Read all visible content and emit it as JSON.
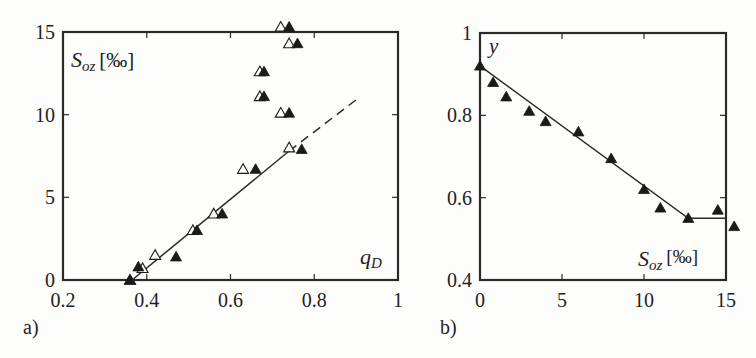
{
  "chart_data": [
    {
      "panel_label": "a)",
      "type": "scatter",
      "title": "",
      "xlabel": "q_D",
      "xlabel_main": "q",
      "xlabel_sub": "D",
      "ylabel": "S_oz [‰]",
      "ylabel_main": "S",
      "ylabel_sub": "oz",
      "ylabel_unit": "[‰]",
      "xlim": [
        0.2,
        1.0
      ],
      "ylim": [
        0,
        15
      ],
      "xticks": [
        "0.2",
        "0.4",
        "0.6",
        "0.8",
        "1"
      ],
      "yticks": [
        "0",
        "5",
        "10",
        "15"
      ],
      "grid": false,
      "legend": "none",
      "series": [
        {
          "name": "open triangles",
          "marker": "open-triangle",
          "x": [
            0.36,
            0.39,
            0.42,
            0.51,
            0.56,
            0.63,
            0.67,
            0.67,
            0.72,
            0.72,
            0.74,
            0.74
          ],
          "y": [
            0.0,
            0.7,
            1.5,
            3.0,
            4.0,
            6.7,
            11.1,
            12.6,
            10.1,
            15.3,
            8.0,
            14.3
          ]
        },
        {
          "name": "filled triangles",
          "marker": "filled-triangle",
          "x": [
            0.36,
            0.38,
            0.47,
            0.52,
            0.58,
            0.66,
            0.68,
            0.68,
            0.74,
            0.74,
            0.76,
            0.77
          ],
          "y": [
            0.0,
            0.8,
            1.4,
            3.0,
            4.0,
            6.7,
            11.1,
            12.6,
            10.1,
            15.3,
            14.3,
            7.9
          ]
        },
        {
          "name": "fit line (solid)",
          "type": "line",
          "style": "solid",
          "x": [
            0.365,
            0.74
          ],
          "y": [
            0.0,
            7.8
          ]
        },
        {
          "name": "fit line (extrapolated, dashed)",
          "type": "line",
          "style": "dashed",
          "x": [
            0.74,
            0.9
          ],
          "y": [
            7.8,
            10.9
          ]
        }
      ]
    },
    {
      "panel_label": "b)",
      "type": "scatter",
      "title": "",
      "xlabel": "S_oz [‰]",
      "xlabel_main": "S",
      "xlabel_sub": "oz",
      "xlabel_unit": "[‰]",
      "ylabel": "y",
      "xlim": [
        0,
        15
      ],
      "ylim": [
        0.4,
        1.0
      ],
      "xticks": [
        "0",
        "5",
        "10",
        "15"
      ],
      "yticks": [
        "0.4",
        "0.6",
        "0.8",
        "1"
      ],
      "grid": false,
      "legend": "none",
      "series": [
        {
          "name": "filled triangles",
          "marker": "filled-triangle",
          "x": [
            0.0,
            0.8,
            1.6,
            3.0,
            4.0,
            6.0,
            8.0,
            10.0,
            11.0,
            12.7,
            14.5,
            15.5
          ],
          "y": [
            0.92,
            0.88,
            0.845,
            0.81,
            0.785,
            0.76,
            0.695,
            0.62,
            0.575,
            0.55,
            0.57,
            0.53
          ]
        },
        {
          "name": "piecewise fit line",
          "type": "line",
          "style": "solid",
          "x": [
            0.0,
            12.7,
            15.0
          ],
          "y": [
            0.92,
            0.55,
            0.55
          ]
        }
      ]
    }
  ]
}
